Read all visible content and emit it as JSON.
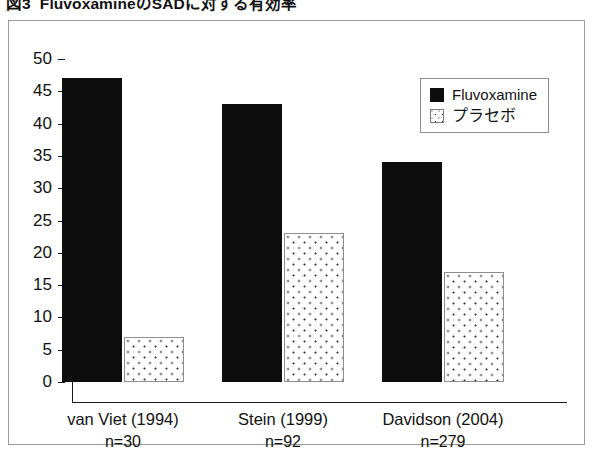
{
  "figure": {
    "number": "図3",
    "caption": "FluvoxamineのSADに対する有効率"
  },
  "legend": {
    "position": "top-right",
    "entries": [
      {
        "label": "Fluvoxamine",
        "swatch": "solid-black-square-icon"
      },
      {
        "label": "プラセボ",
        "swatch": "dotted-white-square-icon"
      }
    ]
  },
  "chart_data": {
    "type": "bar",
    "title": "FluvoxamineのSADに対する有効率",
    "xlabel": "",
    "ylabel": "",
    "ylim": [
      0,
      50
    ],
    "yticks": [
      0,
      5,
      10,
      15,
      20,
      25,
      30,
      35,
      40,
      45,
      50
    ],
    "ytick_labels": [
      "0",
      "5",
      "10",
      "15",
      "20",
      "25",
      "30",
      "35",
      "40",
      "45",
      "50"
    ],
    "grid": false,
    "categories": [
      "van Viet (1994)",
      "Stein (1999)",
      "Davidson (2004)"
    ],
    "category_sublabels": [
      "n=30",
      "n=92",
      "n=279"
    ],
    "series": [
      {
        "name": "Fluvoxamine",
        "values": [
          47,
          43,
          34
        ],
        "color": "#0d0d0d"
      },
      {
        "name": "プラセボ",
        "values": [
          7,
          23,
          17
        ],
        "color": "#ffffff"
      }
    ]
  }
}
